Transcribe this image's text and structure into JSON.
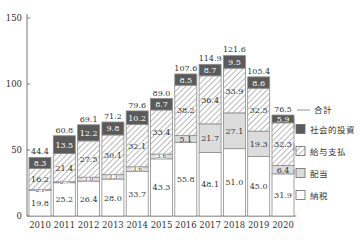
{
  "chart_data": {
    "type": "bar",
    "stacked": true,
    "title": "",
    "xlabel": "",
    "ylabel": "",
    "ylim": [
      0,
      150
    ],
    "yticks": [
      0,
      50,
      100,
      150
    ],
    "grid": false,
    "legend_position": "right",
    "categories": [
      "2010",
      "2011",
      "2012",
      "2013",
      "2014",
      "2015",
      "2016",
      "2017",
      "2018",
      "2019",
      "2020"
    ],
    "series": [
      {
        "name": "納税",
        "style": "white",
        "values": [
          19.8,
          25.2,
          26.4,
          28.0,
          33.7,
          43.3,
          55.8,
          48.1,
          51.0,
          45.0,
          31.9
        ]
      },
      {
        "name": "配当",
        "style": "lightgray",
        "values": [
          0.1,
          0.7,
          3.0,
          3.3,
          3.6,
          3.6,
          5.1,
          21.7,
          27.1,
          19.3,
          6.4
        ]
      },
      {
        "name": "給与支払",
        "style": "hatched",
        "values": [
          16.2,
          21.4,
          27.5,
          30.1,
          32.1,
          33.4,
          38.2,
          36.4,
          33.9,
          32.5,
          32.3
        ]
      },
      {
        "name": "社会的投資",
        "style": "dark",
        "values": [
          8.3,
          13.5,
          12.2,
          9.8,
          10.2,
          8.7,
          8.5,
          8.7,
          9.5,
          8.6,
          5.9
        ]
      }
    ],
    "totals": {
      "name": "合計",
      "values": [
        44.4,
        60.8,
        69.1,
        71.2,
        79.6,
        89.0,
        107.6,
        114.9,
        121.6,
        105.4,
        76.5
      ]
    },
    "legend": [
      "合計",
      "社会的投資",
      "給与支払",
      "配当",
      "納税"
    ],
    "colors": {
      "dark": "#5a5a5a",
      "lightgray": "#dcdcdc",
      "hatch": "#8a8a8a",
      "white": "#ffffff",
      "border": "#8c8c8c",
      "text": "#333333"
    }
  }
}
